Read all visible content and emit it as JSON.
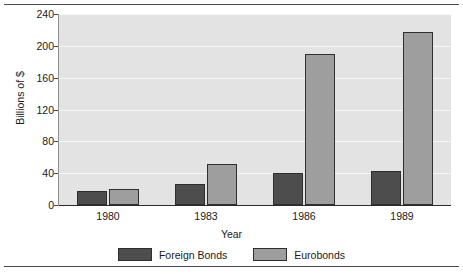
{
  "chart_data": {
    "type": "bar",
    "title": "",
    "xlabel": "Year",
    "ylabel": "Billions of $",
    "categories": [
      "1980",
      "1983",
      "1986",
      "1989"
    ],
    "series": [
      {
        "name": "Foreign Bonds",
        "color": "#4d4d4d",
        "values": [
          18,
          27,
          40,
          43
        ]
      },
      {
        "name": "Eurobonds",
        "color": "#9e9e9e",
        "values": [
          20,
          52,
          190,
          217
        ]
      }
    ],
    "ylim": [
      0,
      240
    ],
    "yticks": [
      0,
      40,
      80,
      120,
      160,
      200,
      240
    ],
    "ytick_labels": [
      "0",
      "40",
      "80",
      "120",
      "160",
      "200",
      "240"
    ],
    "grid": true,
    "grid_axis": "y",
    "legend_position": "bottom",
    "plot_background": "#e3e3e3",
    "gridline_color": "#f7f7f7"
  }
}
